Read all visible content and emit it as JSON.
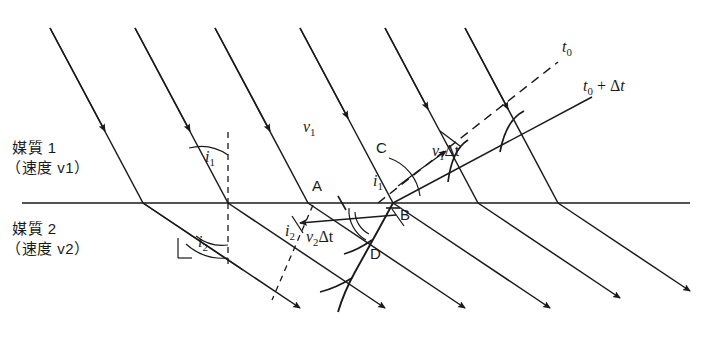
{
  "figure": {
    "stroke_color": "#1a1a1a",
    "background": "#ffffff"
  },
  "media": {
    "upper": {
      "name": "媒質 1",
      "speed": "（速度 v1）",
      "speed_sub": "1"
    },
    "lower": {
      "name": "媒質 2",
      "speed": "（速度 v2）",
      "speed_sub": "2"
    }
  },
  "labels": {
    "v1_region": "v",
    "v1_region_sub": "1",
    "wavefront_t0": "t0",
    "wavefront_t0_dt": "t0 + Δt",
    "seg_v1dt": "v1Δt",
    "seg_v2dt": "v2Δt",
    "angle_i1_left": "i1",
    "angle_i1_right": "i1",
    "angle_i2_left": "i2",
    "angle_i2_right": "i2",
    "point_a": "A",
    "point_b": "B",
    "point_c": "C",
    "point_d": "D"
  },
  "geometry": {
    "interface_y": 203,
    "interface_x1": 22,
    "interface_x2": 690,
    "incident_angle_deg": 28,
    "refracted_angle_deg": 56,
    "ray_count_incident": 6,
    "ray_count_refracted": 6
  }
}
